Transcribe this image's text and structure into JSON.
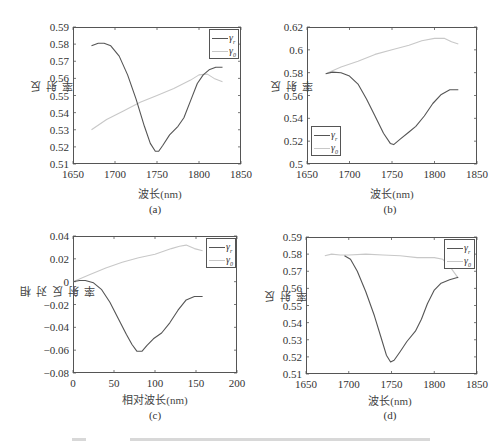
{
  "colors": {
    "series_r1": "#555555",
    "series_r0": "#c8c8c8",
    "frame": "#555555"
  },
  "chart_data": [
    {
      "id": "a",
      "type": "line",
      "sublabel": "(a)",
      "xlabel": "波长(nm)",
      "ylabel": "反射率",
      "xlim": [
        1650,
        1850
      ],
      "ylim": [
        0.51,
        0.59
      ],
      "xticks": [
        "1650",
        "1700",
        "1750",
        "1800",
        "1850"
      ],
      "yticks": [
        "0.59",
        "0.58",
        "0.57",
        "0.56",
        "0.55",
        "0.54",
        "0.53",
        "0.52",
        "0.51"
      ],
      "legend_position": "upper right",
      "grid": false,
      "series": [
        {
          "name": "γ_r",
          "color": "#555555",
          "x": [
            1672,
            1680,
            1687,
            1695,
            1705,
            1715,
            1725,
            1735,
            1742,
            1748,
            1752,
            1757,
            1765,
            1775,
            1782,
            1790,
            1798,
            1805,
            1812,
            1820,
            1828
          ],
          "y": [
            0.579,
            0.5805,
            0.5805,
            0.579,
            0.573,
            0.562,
            0.548,
            0.532,
            0.522,
            0.5175,
            0.5175,
            0.521,
            0.527,
            0.532,
            0.537,
            0.547,
            0.557,
            0.562,
            0.565,
            0.5665,
            0.5665
          ]
        },
        {
          "name": "γ_0",
          "color": "#c8c8c8",
          "x": [
            1672,
            1690,
            1710,
            1730,
            1750,
            1770,
            1790,
            1800,
            1810,
            1818,
            1828
          ],
          "y": [
            0.53,
            0.536,
            0.541,
            0.546,
            0.55,
            0.554,
            0.559,
            0.562,
            0.5625,
            0.56,
            0.558
          ]
        }
      ]
    },
    {
      "id": "b",
      "type": "line",
      "sublabel": "(b)",
      "xlabel": "波长(nm)",
      "ylabel": "反射率",
      "xlim": [
        1650,
        1850
      ],
      "ylim": [
        0.5,
        0.62
      ],
      "xticks": [
        "1650",
        "1700",
        "1750",
        "1800",
        "1850"
      ],
      "yticks": [
        "0.62",
        "0.6",
        "0.58",
        "0.56",
        "0.54",
        "0.52",
        "0.5"
      ],
      "legend_position": "lower left",
      "grid": false,
      "series": [
        {
          "name": "γ_r",
          "color": "#555555",
          "x": [
            1672,
            1680,
            1690,
            1700,
            1710,
            1720,
            1730,
            1740,
            1748,
            1752,
            1760,
            1770,
            1778,
            1788,
            1798,
            1808,
            1818,
            1828
          ],
          "y": [
            0.579,
            0.5805,
            0.58,
            0.577,
            0.57,
            0.557,
            0.542,
            0.527,
            0.518,
            0.517,
            0.522,
            0.528,
            0.533,
            0.542,
            0.553,
            0.561,
            0.565,
            0.565
          ]
        },
        {
          "name": "γ_0",
          "color": "#c8c8c8",
          "x": [
            1672,
            1690,
            1710,
            1730,
            1750,
            1770,
            1785,
            1800,
            1812,
            1820,
            1828
          ],
          "y": [
            0.579,
            0.585,
            0.59,
            0.596,
            0.6,
            0.604,
            0.608,
            0.61,
            0.61,
            0.607,
            0.605
          ]
        }
      ]
    },
    {
      "id": "c",
      "type": "line",
      "sublabel": "(c)",
      "xlabel": "相对波长(nm)",
      "ylabel": "相对反射率",
      "xlim": [
        0,
        200
      ],
      "ylim": [
        -0.08,
        0.04
      ],
      "xticks": [
        "0",
        "50",
        "100",
        "150",
        "200"
      ],
      "yticks": [
        "0.04",
        "0.02",
        "0",
        "−0.02",
        "−0.04",
        "−0.06",
        "−0.08"
      ],
      "legend_position": "upper right",
      "grid": false,
      "series": [
        {
          "name": "γ_r",
          "color": "#555555",
          "x": [
            0,
            8,
            15,
            25,
            35,
            45,
            55,
            65,
            72,
            78,
            84,
            90,
            98,
            108,
            118,
            128,
            138,
            148,
            158
          ],
          "y": [
            0.0,
            0.001,
            0.001,
            -0.001,
            -0.007,
            -0.018,
            -0.032,
            -0.046,
            -0.055,
            -0.061,
            -0.061,
            -0.056,
            -0.05,
            -0.045,
            -0.036,
            -0.025,
            -0.016,
            -0.013,
            -0.013
          ]
        },
        {
          "name": "γ_0",
          "color": "#c8c8c8",
          "x": [
            0,
            20,
            40,
            60,
            80,
            100,
            120,
            130,
            138,
            148,
            158
          ],
          "y": [
            0.0,
            0.006,
            0.012,
            0.017,
            0.021,
            0.024,
            0.029,
            0.031,
            0.032,
            0.029,
            0.027
          ]
        }
      ]
    },
    {
      "id": "d",
      "type": "line",
      "sublabel": "(d)",
      "xlabel": "波长(nm)",
      "ylabel": "反射率",
      "xlim": [
        1650,
        1850
      ],
      "ylim": [
        0.51,
        0.59
      ],
      "xticks": [
        "1650",
        "1700",
        "1750",
        "1800",
        "1850"
      ],
      "yticks": [
        "0.59",
        "0.58",
        "0.57",
        "0.56",
        "0.55",
        "0.54",
        "0.53",
        "0.52",
        "0.51"
      ],
      "legend_position": "upper right",
      "grid": false,
      "series": [
        {
          "name": "γ_r",
          "color": "#555555",
          "x": [
            1695,
            1702,
            1710,
            1720,
            1730,
            1738,
            1744,
            1749,
            1753,
            1760,
            1768,
            1778,
            1785,
            1792,
            1800,
            1808,
            1818,
            1828
          ],
          "y": [
            0.579,
            0.577,
            0.57,
            0.558,
            0.544,
            0.531,
            0.521,
            0.517,
            0.518,
            0.523,
            0.529,
            0.535,
            0.542,
            0.551,
            0.559,
            0.563,
            0.565,
            0.5665
          ]
        },
        {
          "name": "γ_0",
          "color": "#c8c8c8",
          "x": [
            1672,
            1680,
            1690,
            1700,
            1720,
            1740,
            1760,
            1780,
            1800,
            1810,
            1818,
            1828
          ],
          "y": [
            0.579,
            0.58,
            0.5795,
            0.5795,
            0.58,
            0.5795,
            0.579,
            0.578,
            0.578,
            0.577,
            0.573,
            0.566
          ]
        }
      ]
    }
  ],
  "legend_labels": {
    "r1": "γ",
    "r1_sub": "r",
    "r0": "γ",
    "r0_sub": "0"
  },
  "caption": "图 … (caption truncated at bottom edge)"
}
